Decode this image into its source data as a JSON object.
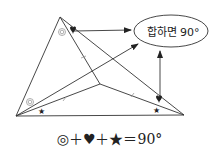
{
  "diagram": {
    "type": "triangle-angle-sum",
    "ellipse_label": "합하면 90°",
    "formula": "◎＋♥＋★＝90°",
    "marks": {
      "double_circle": "◎",
      "heart": "♥",
      "star": "★"
    },
    "colors": {
      "line": "#333333",
      "text": "#222222",
      "tick": "#999999"
    }
  }
}
